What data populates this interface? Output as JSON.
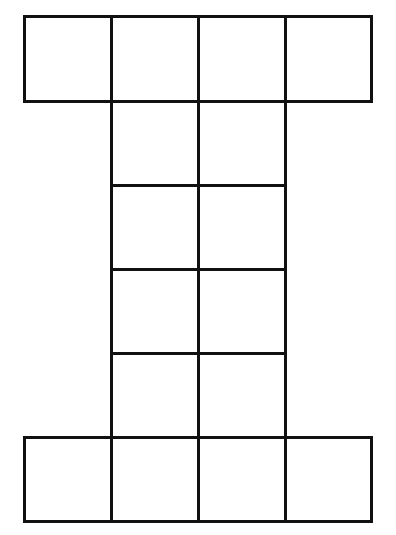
{
  "diagram": {
    "title": "",
    "line_color": "#111111",
    "background": "#ffffff",
    "stroke_width": 3,
    "column_edges_x": [
      24,
      111,
      198,
      285,
      371
    ],
    "row_edges_y": [
      16,
      101,
      185,
      269,
      353,
      437,
      521
    ],
    "cells": [
      {
        "row": 0,
        "col": 0
      },
      {
        "row": 0,
        "col": 1
      },
      {
        "row": 0,
        "col": 2
      },
      {
        "row": 0,
        "col": 3
      },
      {
        "row": 1,
        "col": 1
      },
      {
        "row": 1,
        "col": 2
      },
      {
        "row": 2,
        "col": 1
      },
      {
        "row": 2,
        "col": 2
      },
      {
        "row": 3,
        "col": 1
      },
      {
        "row": 3,
        "col": 2
      },
      {
        "row": 4,
        "col": 1
      },
      {
        "row": 4,
        "col": 2
      },
      {
        "row": 5,
        "col": 0
      },
      {
        "row": 5,
        "col": 1
      },
      {
        "row": 5,
        "col": 2
      },
      {
        "row": 5,
        "col": 3
      }
    ],
    "cell_count": 16
  }
}
